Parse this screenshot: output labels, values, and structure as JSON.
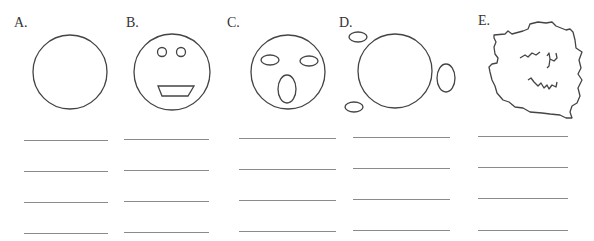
{
  "worksheet": {
    "items": [
      {
        "label": "A.",
        "label_pos": [
          14,
          16
        ],
        "figure": "plain-circle",
        "circle": {
          "cx": 70,
          "cy": 72,
          "r": 37
        },
        "features": [],
        "lines": {
          "x1": 24,
          "x2": 108,
          "ys": [
            140,
            171,
            202,
            233
          ]
        }
      },
      {
        "label": "B.",
        "label_pos": [
          126,
          16
        ],
        "figure": "smiling-face",
        "circle": {
          "cx": 172,
          "cy": 72,
          "r": 38
        },
        "features": [
          {
            "type": "circle",
            "cx": 162,
            "cy": 52,
            "r": 4.5
          },
          {
            "type": "circle",
            "cx": 181,
            "cy": 52,
            "r": 4.5
          },
          {
            "type": "polygon",
            "points": "158,86 194,86 188,96 162,96"
          }
        ],
        "lines": {
          "x1": 124,
          "x2": 209,
          "ys": [
            139,
            170,
            201,
            232
          ]
        }
      },
      {
        "label": "C.",
        "label_pos": [
          227,
          16
        ],
        "figure": "surprised-face",
        "circle": {
          "cx": 288,
          "cy": 72,
          "r": 37
        },
        "features": [
          {
            "type": "ellipse",
            "cx": 270,
            "cy": 60,
            "rx": 9,
            "ry": 5
          },
          {
            "type": "ellipse",
            "cx": 309,
            "cy": 61,
            "rx": 9,
            "ry": 5
          },
          {
            "type": "ellipse",
            "cx": 287,
            "cy": 89,
            "rx": 9,
            "ry": 14
          }
        ],
        "lines": {
          "x1": 239,
          "x2": 336,
          "ys": [
            138,
            169,
            200,
            231
          ]
        }
      },
      {
        "label": "D.",
        "label_pos": [
          339,
          16
        ],
        "figure": "scattered-features-circle",
        "circle": {
          "cx": 395,
          "cy": 71,
          "r": 37
        },
        "features": [
          {
            "type": "ellipse",
            "cx": 358,
            "cy": 37,
            "rx": 9,
            "ry": 5
          },
          {
            "type": "ellipse",
            "cx": 354,
            "cy": 107,
            "rx": 9,
            "ry": 5
          },
          {
            "type": "ellipse",
            "cx": 446,
            "cy": 78,
            "rx": 9,
            "ry": 14
          }
        ],
        "lines": {
          "x1": 353,
          "x2": 450,
          "ys": [
            137,
            168,
            199,
            230
          ]
        }
      },
      {
        "label": "E.",
        "label_pos": [
          478,
          14
        ],
        "figure": "scribbled-blob",
        "outline": "M494,35 L505,34 L508,31 L512,34 L523,31 L528,29 L530,24 L538,22 L546,23 L552,22 L556,26 L566,30 L570,29 L573,32 L575,40 L576,48 L582,52 L579,60 L581,68 L578,74 L582,80 L578,88 L580,96 L577,103 L572,106 L570,112 L572,118 L566,118 L560,115 L550,114 L542,113 L530,112 L523,108 L515,107 L509,102 L503,100 L497,93 L495,86 L492,80 L490,72 L489,67 L492,64 L497,63 L498,58 L495,54 L494,47 L496,42 L494,38 Z",
        "scribbles": [
          "M520,58 L525,55 L528,57 L532,53 L536,55 L540,52",
          "M547,56 L549,53 L550,59 L549,66 L547,68 M550,59 L554,61 L557,58 L556,53",
          "M528,80 L531,78 L534,82 L538,86 L541,83 L544,88 L547,85 L549,89 L552,85 L556,87 L557,82"
        ],
        "lines": {
          "x1": 478,
          "x2": 568,
          "ys": [
            136,
            167,
            198,
            230
          ]
        }
      }
    ]
  },
  "colors": {
    "stroke": "#444444",
    "line": "#8a8a8a",
    "text": "#333333",
    "background": "#ffffff"
  }
}
